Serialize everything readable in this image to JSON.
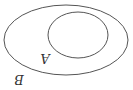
{
  "diagram": {
    "type": "venn-subset",
    "orientation": "rotated-180",
    "sets": [
      {
        "id": "outer",
        "label": "B",
        "cx": 66,
        "cy": 40,
        "rx": 62,
        "ry": 35
      },
      {
        "id": "inner",
        "label": "A",
        "cx": 78,
        "cy": 35,
        "rx": 30,
        "ry": 23
      }
    ],
    "relation": "A ⊂ B",
    "colors": {
      "stroke": "#555555",
      "text": "#333333",
      "background": "#ffffff"
    }
  }
}
